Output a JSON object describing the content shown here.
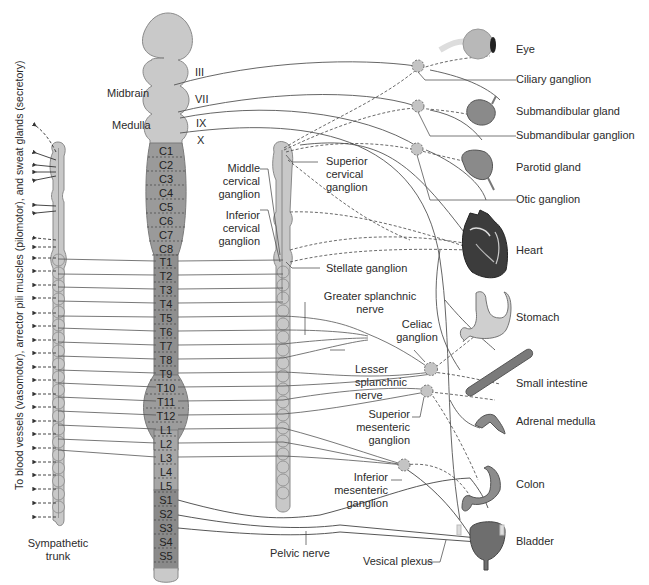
{
  "diagram": {
    "colors": {
      "spinal_light": "#c8c8c8",
      "spinal_dark": "#8e8e8e",
      "outline": "#7a7a7a",
      "nerve_line": "#555555",
      "ganglion": "#bdbdbd",
      "text": "#2b2b2b"
    },
    "brain_labels": {
      "midbrain": "Midbrain",
      "medulla": "Medulla"
    },
    "cranial_nerves": [
      "III",
      "VII",
      "IX",
      "X"
    ],
    "spinal_segments": [
      "C1",
      "C2",
      "C3",
      "C4",
      "C5",
      "C6",
      "C7",
      "C8",
      "T1",
      "T2",
      "T3",
      "T4",
      "T5",
      "T6",
      "T7",
      "T8",
      "T9",
      "T10",
      "T11",
      "T12",
      "L1",
      "L2",
      "L3",
      "L4",
      "L5",
      "S1",
      "S2",
      "S3",
      "S4",
      "S5"
    ],
    "left_vertical_label": "To blood vessels (vasomotor), arrector pili muscles (pilomotor), and sweat glands (secretory)",
    "sympathetic_trunk_label": [
      "Sympathetic",
      "trunk"
    ],
    "cervical_ganglia": {
      "middle": [
        "Middle",
        "cervical",
        "ganglion"
      ],
      "inferior": [
        "Inferior",
        "cervical",
        "ganglion"
      ],
      "superior": [
        "Superior",
        "cervical",
        "ganglion"
      ],
      "stellate": "Stellate ganglion"
    },
    "abdominal": {
      "greater_splanchnic": [
        "Greater splanchnic",
        "nerve"
      ],
      "lesser_splanchnic": [
        "Lesser",
        "splanchnic",
        "nerve"
      ],
      "celiac": [
        "Celiac",
        "ganglion"
      ],
      "superior_mesenteric": [
        "Superior",
        "mesenteric",
        "ganglion"
      ],
      "inferior_mesenteric": [
        "Inferior",
        "mesenteric",
        "ganglion"
      ],
      "pelvic_nerve": "Pelvic nerve",
      "vesical_plexus": "Vesical plexus"
    },
    "targets": [
      {
        "name": "eye",
        "label": "Eye"
      },
      {
        "name": "ciliary-ganglion",
        "label": "Ciliary ganglion"
      },
      {
        "name": "submandibular-gland",
        "label": "Submandibular gland"
      },
      {
        "name": "submandibular-ganglion",
        "label": "Submandibular ganglion"
      },
      {
        "name": "parotid-gland",
        "label": "Parotid gland"
      },
      {
        "name": "otic-ganglion",
        "label": "Otic ganglion"
      },
      {
        "name": "heart",
        "label": "Heart"
      },
      {
        "name": "stomach",
        "label": "Stomach"
      },
      {
        "name": "small-intestine",
        "label": "Small intestine"
      },
      {
        "name": "adrenal-medulla",
        "label": "Adrenal medulla"
      },
      {
        "name": "colon",
        "label": "Colon"
      },
      {
        "name": "bladder",
        "label": "Bladder"
      }
    ]
  }
}
